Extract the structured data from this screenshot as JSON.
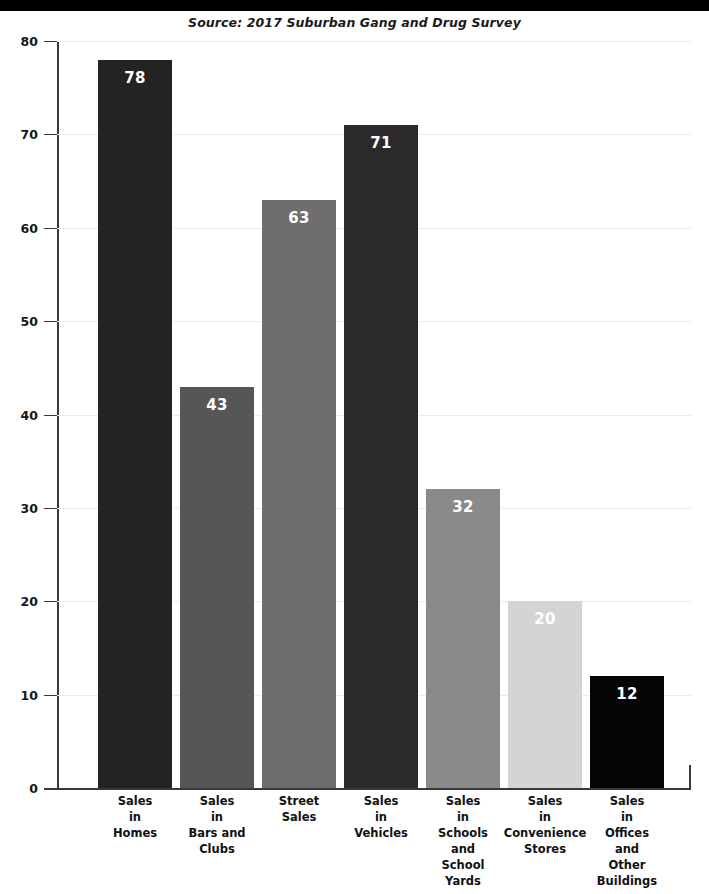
{
  "header": {
    "top_band": "",
    "source_note": "Source: 2017 Suburban Gang and Drug Survey"
  },
  "chart_data": {
    "type": "bar",
    "title": "",
    "subtitle": "",
    "source": "Source: 2017 Suburban Gang and Drug Survey",
    "xlabel": "",
    "ylabel": "",
    "ylim": [
      0,
      80
    ],
    "yticks": [
      0,
      10,
      20,
      30,
      40,
      50,
      60,
      70,
      80
    ],
    "ytick_labels": [
      "0",
      "10",
      "20",
      "30",
      "40",
      "50",
      "60",
      "70",
      "80"
    ],
    "grid": true,
    "grid_axis": "y",
    "legend": false,
    "categories": [
      "Sales in Homes",
      "Sales in Bars and Clubs",
      "Street Sales",
      "Sales in Vehicles",
      "Sales in Schools and School Yards",
      "Sales in Convenience Stores",
      "Sales in Offices and Other Buildings"
    ],
    "category_lines": [
      [
        "Sales",
        "in",
        "Homes"
      ],
      [
        "Sales",
        "in",
        "Bars and",
        "Clubs"
      ],
      [
        "Street",
        "Sales"
      ],
      [
        "Sales",
        "in",
        "Vehicles"
      ],
      [
        "Sales",
        "in",
        "Schools",
        "and",
        "School",
        "Yards"
      ],
      [
        "Sales",
        "in",
        "Convenience",
        "Stores"
      ],
      [
        "Sales",
        "in",
        "Offices",
        "and",
        "Other",
        "Buildings"
      ]
    ],
    "values": [
      78,
      43,
      63,
      71,
      32,
      20,
      12
    ],
    "value_labels": [
      "78",
      "43",
      "63",
      "71",
      "32",
      "20",
      "12"
    ],
    "bar_colors": [
      "#232323",
      "#565656",
      "#6e6e6e",
      "#2a2a2a",
      "#8a8a8a",
      "#d4d4d4",
      "#050505"
    ]
  },
  "colors": {
    "background": "#ffffff",
    "axis": "#3a3a3a",
    "gridline": "#ececec",
    "value_label": "#ffffff",
    "tick_label": "#161616",
    "category_label": "#111111",
    "top_band": "#000000"
  }
}
